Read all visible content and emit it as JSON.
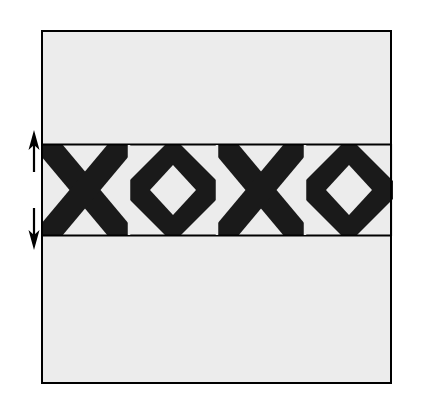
{
  "figure": {
    "type": "technical-line-drawing",
    "canvas": {
      "width": 433,
      "height": 407,
      "background": "#ffffff"
    },
    "colors": {
      "stroke": "#000000",
      "fill_light": "#ececec",
      "fill_dark": "#1a1a1a",
      "page_background": "#ffffff"
    },
    "outer_panel": {
      "name": "outer-rectangle",
      "x": 41,
      "y": 30,
      "width": 351,
      "height": 354,
      "fill": "#ececec",
      "stroke": "#000000",
      "stroke_width": 2
    },
    "band": {
      "name": "patterned-band",
      "x": 41,
      "y": 144,
      "width": 351,
      "height": 92,
      "fill": "#ececec",
      "stroke": "#000000",
      "stroke_width": 2,
      "cell_count": 4,
      "cell_width": 88,
      "stripe_width": 17,
      "cells": [
        {
          "index": 0,
          "motif": "cross-x",
          "x": 41
        },
        {
          "index": 1,
          "motif": "diamond-o",
          "x": 129
        },
        {
          "index": 2,
          "motif": "cross-x",
          "x": 217
        },
        {
          "index": 3,
          "motif": "diamond-o",
          "x": 305
        }
      ],
      "dividers": [
        129,
        217,
        305
      ]
    },
    "arrows": [
      {
        "name": "band-top-extent-arrow",
        "direction": "up",
        "x": 34,
        "tail_y": 172,
        "head_y": 131,
        "stroke_width": 2
      },
      {
        "name": "band-bottom-extent-arrow",
        "direction": "down",
        "x": 34,
        "tail_y": 208,
        "head_y": 249,
        "stroke_width": 2
      }
    ]
  }
}
